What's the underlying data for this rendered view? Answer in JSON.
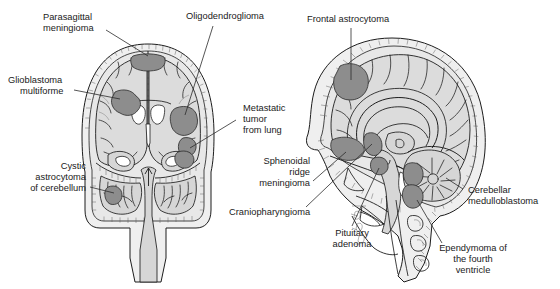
{
  "figure": {
    "type": "medical-illustration",
    "panels": [
      {
        "id": "coronal",
        "view": "coronal section of brain and skull"
      },
      {
        "id": "sagittal",
        "view": "midsagittal section of brain and skull"
      }
    ]
  },
  "labels": {
    "parasagittal_meningioma": "Parasagittal\nmeningioma",
    "parasagittal_meningioma_l1": "Parasagittal",
    "parasagittal_meningioma_l2": "meningioma",
    "glioblastoma_l1": "Glioblastoma",
    "glioblastoma_l2": "multiforme",
    "cystic_l1": "Cystic",
    "cystic_l2": "astrocytoma",
    "cystic_l3": "of cerebellum",
    "oligodendroglioma": "Oligodendroglioma",
    "metastatic_l1": "Metastatic",
    "metastatic_l2": "tumor",
    "metastatic_l3": "from lung",
    "sphenoidal_l1": "Sphenoidal",
    "sphenoidal_l2": "ridge",
    "sphenoidal_l3": "meningioma",
    "craniopharyngioma": "Craniopharyngioma",
    "pituitary_l1": "Pituitary",
    "pituitary_l2": "adenoma",
    "frontal_astrocytoma": "Frontal astrocytoma",
    "cerebellar_l1": "Cerebellar",
    "cerebellar_l2": "medulloblastoma",
    "ependymoma_l1": "Ependymoma of",
    "ependymoma_l2": "the fourth",
    "ependymoma_l3": "ventricle"
  },
  "colors": {
    "tumor_gray": "#8d8d8d",
    "brain_gray": "#dcdcdc",
    "skull_gray": "#efefef",
    "ventricle_white": "#ffffff",
    "ink": "#1d1d1d",
    "text": "#1a1a1a",
    "background": "#ffffff"
  },
  "tumor_sites": [
    {
      "name": "Parasagittal meningioma",
      "panel": "coronal",
      "position": "superior midline, attached to falx"
    },
    {
      "name": "Glioblastoma multiforme",
      "panel": "coronal",
      "position": "left cerebral hemisphere white matter"
    },
    {
      "name": "Oligodendroglioma",
      "panel": "coronal",
      "position": "right cerebral hemisphere cortex"
    },
    {
      "name": "Metastatic tumor from lung",
      "panel": "coronal",
      "position": "right hemisphere, two rounded deposits"
    },
    {
      "name": "Cystic astrocytoma of cerebellum",
      "panel": "coronal",
      "position": "left cerebellar hemisphere"
    },
    {
      "name": "Frontal astrocytoma",
      "panel": "sagittal",
      "position": "frontal lobe"
    },
    {
      "name": "Sphenoidal ridge meningioma",
      "panel": "sagittal",
      "position": "anterior skull base, sphenoid ridge"
    },
    {
      "name": "Craniopharyngioma",
      "panel": "sagittal",
      "position": "suprasellar region"
    },
    {
      "name": "Pituitary adenoma",
      "panel": "sagittal",
      "position": "sella turcica"
    },
    {
      "name": "Cerebellar medulloblastoma",
      "panel": "sagittal",
      "position": "cerebellar vermis"
    },
    {
      "name": "Ependymoma of the fourth ventricle",
      "panel": "sagittal",
      "position": "fourth ventricle"
    }
  ]
}
